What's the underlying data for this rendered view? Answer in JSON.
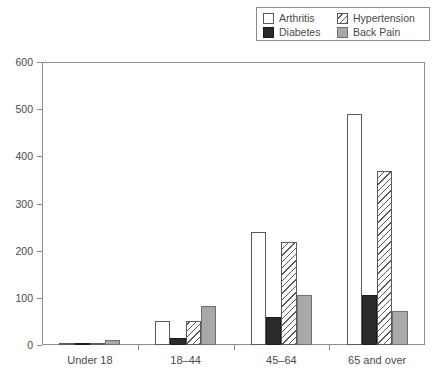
{
  "chart_data": {
    "type": "bar",
    "title": "",
    "subtitle": "",
    "xlabel": "",
    "ylabel": "",
    "categories": [
      "Under 18",
      "18–44",
      "45–64",
      "65 and over"
    ],
    "series": [
      {
        "name": "Arthritis",
        "values": [
          2,
          50,
          240,
          490
        ]
      },
      {
        "name": "Diabetes",
        "values": [
          1,
          15,
          60,
          105
        ]
      },
      {
        "name": "Hypertension",
        "values": [
          2,
          50,
          218,
          368
        ]
      },
      {
        "name": "Back Pain",
        "values": [
          10,
          82,
          107,
          73
        ]
      }
    ],
    "ylim": [
      0,
      600
    ],
    "ytick_values": [
      0,
      100,
      200,
      300,
      400,
      500,
      600
    ],
    "ytick_labels": [
      "0",
      "100",
      "200",
      "300",
      "400",
      "500",
      "600"
    ],
    "grid": false,
    "legend_position": "top-right",
    "legend_columns": 2
  },
  "legend": {
    "entries": [
      {
        "label": "Arthritis",
        "style": "fill-arthritis",
        "swatch_name": "legend-swatch-arthritis"
      },
      {
        "label": "Hypertension",
        "style": "fill-hypertension",
        "swatch_name": "legend-swatch-hypertension"
      },
      {
        "label": "Diabetes",
        "style": "fill-diabetes",
        "swatch_name": "legend-swatch-diabetes"
      },
      {
        "label": "Back Pain",
        "style": "fill-backpain",
        "swatch_name": "legend-swatch-backpain"
      }
    ]
  },
  "colors": {
    "arthritis": "#ffffff",
    "diabetes": "#2b2b2b",
    "hypertension": "#ffffff",
    "back_pain": "#a8a8a8",
    "axis": "#8c8c8c",
    "text": "#4a4a4a",
    "background": "#ffffff"
  }
}
